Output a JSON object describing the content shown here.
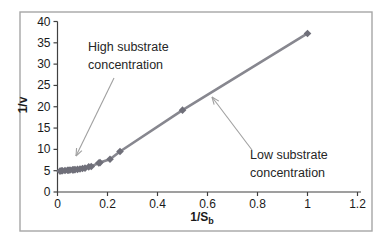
{
  "figure": {
    "frame": {
      "x": 20,
      "y": 12,
      "width": 352,
      "height": 219,
      "border_color": "#a6a6a6",
      "fill": "#ffffff"
    }
  },
  "chart_data": {
    "type": "scatter",
    "title": "",
    "xlabel": "1/S",
    "xlabel_sub": "b",
    "ylabel": "1/v",
    "xlim": [
      0,
      1.2
    ],
    "ylim": [
      0,
      40
    ],
    "x_ticks": [
      "0",
      "0.2",
      "0.4",
      "0.6",
      "0.8",
      "1",
      "1.2"
    ],
    "y_ticks": [
      "0",
      "5",
      "10",
      "15",
      "20",
      "25",
      "30",
      "35",
      "40"
    ],
    "grid": false,
    "legend": "none",
    "series": [
      {
        "name": "1/v versus 1/Sb",
        "color": "#87878f",
        "marker": "diamond",
        "marker_color": "#6f6f79",
        "points": [
          [
            0.01,
            4.9
          ],
          [
            0.015,
            5.0
          ],
          [
            0.02,
            5.0
          ],
          [
            0.03,
            5.05
          ],
          [
            0.04,
            5.1
          ],
          [
            0.045,
            5.1
          ],
          [
            0.05,
            5.15
          ],
          [
            0.06,
            5.2
          ],
          [
            0.065,
            5.2
          ],
          [
            0.07,
            5.25
          ],
          [
            0.08,
            5.3
          ],
          [
            0.09,
            5.4
          ],
          [
            0.1,
            5.5
          ],
          [
            0.11,
            5.6
          ],
          [
            0.125,
            5.9
          ],
          [
            0.135,
            6.0
          ],
          [
            0.165,
            6.8
          ],
          [
            0.17,
            6.9
          ],
          [
            0.21,
            7.7
          ],
          [
            0.25,
            9.5
          ],
          [
            0.5,
            19.2
          ],
          [
            1.0,
            37.2
          ]
        ]
      }
    ],
    "annotations": [
      {
        "text_lines": [
          "High substrate",
          "concentration"
        ],
        "arrow": {
          "x1": 114,
          "y1": 78,
          "x2": 76,
          "y2": 156
        }
      },
      {
        "text_lines": [
          "Low substrate",
          "concentration"
        ],
        "arrow": {
          "x1": 252,
          "y1": 150,
          "x2": 212,
          "y2": 97
        }
      }
    ],
    "colors": {
      "axis": "#404040",
      "tick_label": "#1a1a1a",
      "annotation_text": "#262626",
      "arrow": "#a0a0a0"
    },
    "plot": {
      "x0_px": 57.5,
      "y0_px": 192,
      "px_per_x": 250,
      "px_per_y": 4.2625,
      "x_axis_end_px": 361
    }
  }
}
